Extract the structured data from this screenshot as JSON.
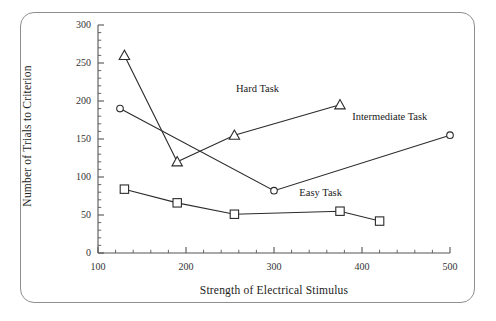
{
  "chart_data": {
    "type": "line",
    "title": "",
    "xlabel": "Strength of Electrical Stimulus",
    "ylabel": "Number of Trials to Criterion",
    "xlim": [
      100,
      500
    ],
    "ylim": [
      0,
      300
    ],
    "xticks": [
      100,
      200,
      300,
      400,
      500
    ],
    "yticks": [
      0,
      50,
      100,
      150,
      200,
      250,
      300
    ],
    "xtick_labels": [
      "100",
      "200",
      "300",
      "400",
      "500"
    ],
    "ytick_labels": [
      "0",
      "50",
      "100",
      "150",
      "200",
      "250",
      "300"
    ],
    "x_minor_per_major": 5,
    "y_minor_per_major": 5,
    "grid": false,
    "legend_position": "inline-annotations",
    "series": [
      {
        "name": "Hard Task",
        "marker": "triangle",
        "label_x": 300,
        "label_y": 215,
        "points": [
          {
            "x": 130,
            "y": 260
          },
          {
            "x": 190,
            "y": 120
          },
          {
            "x": 255,
            "y": 155
          },
          {
            "x": 375,
            "y": 195
          }
        ]
      },
      {
        "name": "Intermediate Task",
        "marker": "circle",
        "label_x": 432,
        "label_y": 178,
        "points": [
          {
            "x": 125,
            "y": 190
          },
          {
            "x": 300,
            "y": 82
          },
          {
            "x": 500,
            "y": 155
          }
        ]
      },
      {
        "name": "Easy Task",
        "marker": "square",
        "label_x": 372,
        "label_y": 78,
        "points": [
          {
            "x": 130,
            "y": 84
          },
          {
            "x": 190,
            "y": 66
          },
          {
            "x": 255,
            "y": 51
          },
          {
            "x": 375,
            "y": 55
          },
          {
            "x": 420,
            "y": 42
          }
        ]
      }
    ],
    "colors": {
      "line": "#2b2b2b",
      "marker_fill": "#ffffff",
      "marker_stroke": "#2b2b2b",
      "axis": "#555555",
      "frame": "#8e8e8e",
      "background": "#ffffff"
    }
  }
}
